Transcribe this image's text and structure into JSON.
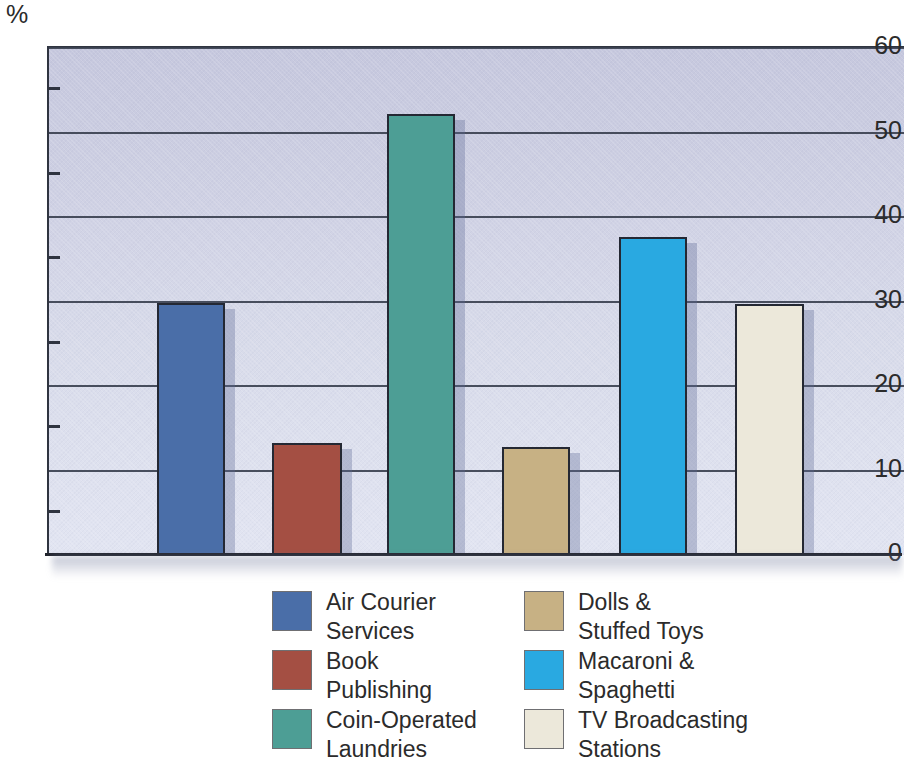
{
  "chart_data": {
    "type": "bar",
    "title": "",
    "subtitle": "",
    "xlabel": "",
    "ylabel": "%",
    "axis_unit": "%",
    "ylim": [
      0,
      60
    ],
    "y_major_ticks": [
      0,
      10,
      20,
      30,
      40,
      50,
      60
    ],
    "y_minor_ticks": [
      5,
      15,
      25,
      35,
      45,
      55
    ],
    "grid": true,
    "legend_position": "below",
    "categories": [
      "Air Courier Services",
      "Book Publishing",
      "Coin-Operated Laundries",
      "Dolls & Stuffed Toys",
      "Macaroni & Spaghetti",
      "TV Broadcasting Stations"
    ],
    "values": [
      29.8,
      13.3,
      52.2,
      12.8,
      37.6,
      29.7
    ],
    "colors": [
      "#4a6ea8",
      "#a44f43",
      "#4d9e95",
      "#c7b184",
      "#29a9e1",
      "#ece8da"
    ]
  },
  "axis": {
    "unit": "%",
    "labels": [
      "60",
      "50",
      "40",
      "30",
      "20",
      "10",
      "0"
    ]
  },
  "legend": {
    "items": [
      {
        "label": "Air Courier\nServices",
        "color": "#4a6ea8"
      },
      {
        "label": "Dolls &\nStuffed Toys",
        "color": "#c7b184"
      },
      {
        "label": "Book\nPublishing",
        "color": "#a44f43"
      },
      {
        "label": "Macaroni &\nSpaghetti",
        "color": "#29a9e1"
      },
      {
        "label": "Coin-Operated\nLaundries",
        "color": "#4d9e95"
      },
      {
        "label": "TV Broadcasting\nStations",
        "color": "#ece8da"
      }
    ]
  },
  "bars": [
    {
      "name": "air-courier-services",
      "left": 155,
      "width": 68,
      "value": 29.8,
      "color": "#4a6ea8"
    },
    {
      "name": "book-publishing",
      "left": 270,
      "width": 70,
      "value": 13.3,
      "color": "#a44f43"
    },
    {
      "name": "coin-operated-laundries",
      "left": 385,
      "width": 68,
      "value": 52.2,
      "color": "#4d9e95"
    },
    {
      "name": "dolls-stuffed-toys",
      "left": 500,
      "width": 68,
      "value": 12.8,
      "color": "#c7b184"
    },
    {
      "name": "macaroni-spaghetti",
      "left": 617,
      "width": 68,
      "value": 37.6,
      "color": "#29a9e1"
    },
    {
      "name": "tv-broadcasting-stations",
      "left": 733,
      "width": 69,
      "value": 29.7,
      "color": "#ece8da"
    }
  ]
}
